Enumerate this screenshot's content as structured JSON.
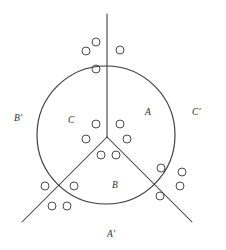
{
  "figure": {
    "type": "geometric-diagram",
    "canvas": {
      "width": 226,
      "height": 250,
      "background": "#ffffff"
    },
    "stroke_color": "#3a3a3a",
    "marker_color": "#4a4a4a",
    "circle": {
      "cx": 106,
      "cy": 135,
      "r": 69
    },
    "junction": {
      "x": 107,
      "y": 137
    },
    "rays": [
      {
        "name": "ray-up",
        "x1": 107,
        "y1": 137,
        "x2": 107,
        "y2": 14
      },
      {
        "name": "ray-lower-left",
        "x1": 107,
        "y1": 137,
        "x2": 22,
        "y2": 222
      },
      {
        "name": "ray-lower-right",
        "x1": 107,
        "y1": 137,
        "x2": 192,
        "y2": 222
      }
    ],
    "interior_labels": [
      {
        "name": "label-A",
        "text": "A",
        "x": 145,
        "y": 108
      },
      {
        "name": "label-B",
        "text": "B",
        "x": 112,
        "y": 181
      },
      {
        "name": "label-C",
        "text": "C",
        "x": 68,
        "y": 116
      }
    ],
    "exterior_labels": [
      {
        "name": "label-A-prime",
        "text": "A′",
        "x": 107,
        "y": 230
      },
      {
        "name": "label-B-prime",
        "text": "B′",
        "x": 14,
        "y": 114
      },
      {
        "name": "label-C-prime",
        "text": "C′",
        "x": 192,
        "y": 108
      }
    ],
    "markers": [
      {
        "name": "marker-top-1",
        "cx": 96,
        "cy": 42,
        "r": 4.0
      },
      {
        "name": "marker-top-2",
        "cx": 86,
        "cy": 51,
        "r": 4.0
      },
      {
        "name": "marker-top-3",
        "cx": 120,
        "cy": 50,
        "r": 4.0
      },
      {
        "name": "marker-top-4",
        "cx": 96,
        "cy": 69,
        "r": 4.0
      },
      {
        "name": "marker-mid-1",
        "cx": 96,
        "cy": 124,
        "r": 4.0
      },
      {
        "name": "marker-mid-2",
        "cx": 120,
        "cy": 124,
        "r": 4.0
      },
      {
        "name": "marker-mid-3",
        "cx": 86,
        "cy": 139,
        "r": 4.0
      },
      {
        "name": "marker-mid-4",
        "cx": 127,
        "cy": 139,
        "r": 4.0
      },
      {
        "name": "marker-mid-5",
        "cx": 101,
        "cy": 155,
        "r": 4.0
      },
      {
        "name": "marker-mid-6",
        "cx": 116,
        "cy": 155,
        "r": 4.0
      },
      {
        "name": "marker-bl-1",
        "cx": 45,
        "cy": 186,
        "r": 4.0
      },
      {
        "name": "marker-bl-2",
        "cx": 74,
        "cy": 186,
        "r": 4.0
      },
      {
        "name": "marker-bl-3",
        "cx": 52,
        "cy": 206,
        "r": 4.0
      },
      {
        "name": "marker-bl-4",
        "cx": 67,
        "cy": 206,
        "r": 4.0
      },
      {
        "name": "marker-br-1",
        "cx": 161,
        "cy": 168,
        "r": 4.0
      },
      {
        "name": "marker-br-2",
        "cx": 182,
        "cy": 172,
        "r": 4.0
      },
      {
        "name": "marker-br-3",
        "cx": 180,
        "cy": 186,
        "r": 4.0
      },
      {
        "name": "marker-br-4",
        "cx": 160,
        "cy": 196,
        "r": 4.0
      }
    ]
  }
}
